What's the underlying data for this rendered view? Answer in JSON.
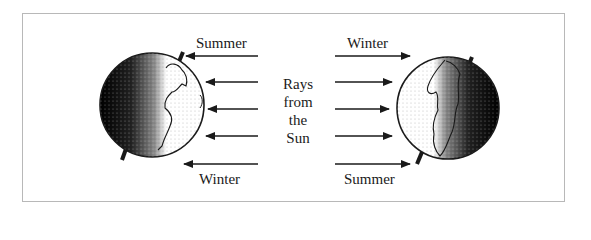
{
  "diagram": {
    "center_label": {
      "lines": [
        "Rays",
        "from",
        "the",
        "Sun"
      ]
    },
    "left_globe": {
      "top_label": "Summer",
      "bottom_label": "Winter",
      "lit_side": "right",
      "ray_direction": "left"
    },
    "right_globe": {
      "top_label": "Winter",
      "bottom_label": "Summer",
      "lit_side": "left",
      "ray_direction": "right"
    },
    "colors": {
      "frame": "#b8b8b8",
      "ink": "#1a1a1a",
      "background": "#ffffff"
    }
  }
}
